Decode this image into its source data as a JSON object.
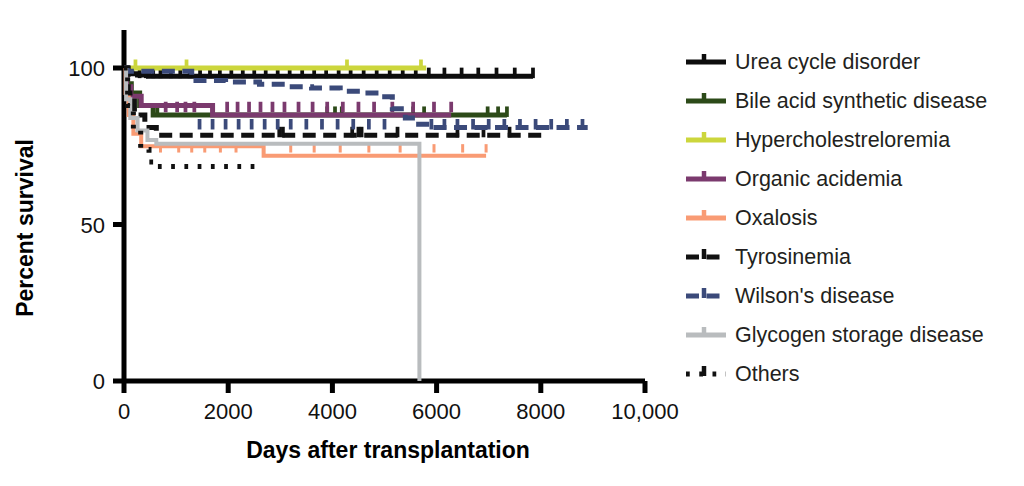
{
  "chart_data": {
    "type": "line",
    "subtype": "kaplan-meier-survival",
    "title": "",
    "xlabel": "Days after transplantation",
    "ylabel": "Percent survival",
    "xlim": [
      0,
      10000
    ],
    "ylim": [
      0,
      105
    ],
    "xticks": [
      0,
      2000,
      4000,
      6000,
      8000,
      10000
    ],
    "xticklabels": [
      "0",
      "2000",
      "4000",
      "6000",
      "8000",
      "10,000"
    ],
    "yticks": [
      0,
      50,
      100
    ],
    "yticklabels": [
      "0",
      "50",
      "100"
    ],
    "grid": false,
    "legend_position": "right",
    "series": [
      {
        "name": "Urea cycle disorder",
        "color": "#0d0d0d",
        "dash": "solid",
        "width": 5,
        "points": [
          [
            0,
            100
          ],
          [
            40,
            99
          ],
          [
            90,
            98.6
          ],
          [
            150,
            98.2
          ],
          [
            260,
            97.8
          ],
          [
            470,
            97.4
          ],
          [
            7850,
            97.4
          ]
        ],
        "censor_days": [
          300,
          420,
          560,
          700,
          900,
          1080,
          1260,
          1460,
          1650,
          1840,
          2060,
          2280,
          2500,
          2720,
          2950,
          3180,
          3420,
          3650,
          3880,
          4120,
          4350,
          4600,
          4850,
          5100,
          5350,
          5600,
          5850,
          6150,
          6480,
          6800,
          7150,
          7500,
          7850
        ],
        "censor_level": 97.4,
        "end_day": 7850,
        "end_value": 97.4
      },
      {
        "name": "Bile acid synthetic disease",
        "color": "#2c4a18",
        "dash": "solid",
        "width": 5,
        "points": [
          [
            0,
            100
          ],
          [
            60,
            95
          ],
          [
            140,
            92
          ],
          [
            300,
            88
          ],
          [
            560,
            85
          ],
          [
            7350,
            85
          ]
        ],
        "censor_days": [
          640,
          3900,
          4050,
          4180,
          5550,
          5760,
          6980,
          7180,
          7350
        ],
        "censor_level": 85,
        "end_day": 7350,
        "end_value": 85
      },
      {
        "name": "Hypercholestreloremia",
        "color": "#ccd63c",
        "dash": "solid",
        "width": 5,
        "points": [
          [
            0,
            100
          ],
          [
            5800,
            100
          ]
        ],
        "censor_days": [
          220,
          1200,
          4280,
          5700
        ],
        "censor_level": 100,
        "end_day": 5800,
        "end_value": 100
      },
      {
        "name": "Organic acidemia",
        "color": "#7b3a6e",
        "dash": "solid",
        "width": 5,
        "points": [
          [
            0,
            100
          ],
          [
            50,
            94
          ],
          [
            130,
            91
          ],
          [
            330,
            88
          ],
          [
            1650,
            88
          ],
          [
            1700,
            85
          ],
          [
            6280,
            85
          ]
        ],
        "censor_days": [
          800,
          1020,
          1180,
          1350,
          1980,
          2180,
          2400,
          2620,
          2850,
          3080,
          3350,
          3620,
          3900,
          4200,
          4500,
          4800,
          5150,
          5550,
          5950,
          6280
        ],
        "censor_level": 86.5,
        "end_day": 6280,
        "end_value": 85
      },
      {
        "name": "Oxalosis",
        "color": "#f99b74",
        "dash": "solid",
        "width": 4,
        "points": [
          [
            0,
            100
          ],
          [
            30,
            92
          ],
          [
            90,
            85
          ],
          [
            180,
            79
          ],
          [
            330,
            75
          ],
          [
            2620,
            75
          ],
          [
            2680,
            72
          ],
          [
            6950,
            72
          ]
        ],
        "censor_days": [
          700,
          1050,
          1300,
          1550,
          1850,
          2150,
          3200,
          3650,
          4150,
          4700,
          5300,
          5950,
          6500,
          6950
        ],
        "censor_level": 73.5,
        "end_day": 6950,
        "end_value": 72
      },
      {
        "name": "Tyrosinemia",
        "color": "#111111",
        "dash": "dash",
        "width": 5,
        "points": [
          [
            0,
            100
          ],
          [
            80,
            92
          ],
          [
            200,
            85
          ],
          [
            400,
            81
          ],
          [
            620,
            78.5
          ],
          [
            8050,
            78.5
          ]
        ],
        "censor_days": [
          2980,
          3050,
          4380,
          4500,
          4560,
          5250,
          6400,
          6900,
          7400
        ],
        "censor_level": 78.5,
        "end_day": 8050,
        "end_value": 78.5
      },
      {
        "name": "Wilson's disease",
        "color": "#3b4a7a",
        "dash": "dash",
        "width": 5,
        "points": [
          [
            0,
            100
          ],
          [
            60,
            99
          ],
          [
            1300,
            96
          ],
          [
            1950,
            95.5
          ],
          [
            2600,
            94.8
          ],
          [
            3150,
            94
          ],
          [
            3600,
            93.6
          ],
          [
            4150,
            92.6
          ],
          [
            4550,
            92
          ],
          [
            4900,
            90.8
          ],
          [
            5150,
            87
          ],
          [
            5400,
            84
          ],
          [
            5600,
            82
          ],
          [
            5900,
            81
          ],
          [
            8900,
            81
          ]
        ],
        "censor_days": [
          1450,
          1700,
          1950,
          2200,
          2450,
          2700,
          2950,
          3200,
          3500,
          3800,
          4100,
          4400,
          4700,
          5000,
          5900,
          6150,
          6400,
          6700,
          7000,
          7300,
          7600,
          7900,
          8200,
          8500,
          8800
        ],
        "censor_level": 81,
        "end_day": 8900,
        "end_value": 81
      },
      {
        "name": "Glycogen storage disease",
        "color": "#b9bcbe",
        "dash": "solid",
        "width": 4,
        "points": [
          [
            0,
            100
          ],
          [
            40,
            90
          ],
          [
            120,
            84
          ],
          [
            260,
            80
          ],
          [
            450,
            77
          ],
          [
            620,
            75.8
          ],
          [
            5670,
            75.8
          ],
          [
            5670,
            0
          ]
        ],
        "censor_days": [],
        "censor_level": 75.8,
        "end_day": 5670,
        "end_value": 0
      },
      {
        "name": "Others",
        "color": "#111111",
        "dash": "dot",
        "width": 5,
        "points": [
          [
            0,
            100
          ],
          [
            70,
            88
          ],
          [
            180,
            80
          ],
          [
            320,
            74
          ],
          [
            480,
            70
          ],
          [
            620,
            68.5
          ],
          [
            2620,
            68.5
          ]
        ],
        "censor_days": [],
        "censor_level": 68.5,
        "end_day": 2620,
        "end_value": 68.5
      }
    ]
  },
  "legend": {
    "items": [
      {
        "label": "Urea cycle disorder",
        "color": "#0d0d0d",
        "style": "solid"
      },
      {
        "label": "Bile acid synthetic disease",
        "color": "#2c4a18",
        "style": "solid"
      },
      {
        "label": "Hypercholestreloremia",
        "color": "#ccd63c",
        "style": "solid"
      },
      {
        "label": "Organic acidemia",
        "color": "#7b3a6e",
        "style": "solid"
      },
      {
        "label": "Oxalosis",
        "color": "#f99b74",
        "style": "solid"
      },
      {
        "label": "Tyrosinemia",
        "color": "#111111",
        "style": "dash"
      },
      {
        "label": "Wilson's disease",
        "color": "#3b4a7a",
        "style": "dash"
      },
      {
        "label": "Glycogen storage disease",
        "color": "#b9bcbe",
        "style": "solid"
      },
      {
        "label": "Others",
        "color": "#111111",
        "style": "dot"
      }
    ]
  }
}
